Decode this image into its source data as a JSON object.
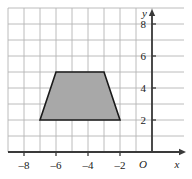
{
  "figure": {
    "name": "coordinate-grid-with-trapezoid",
    "background_color": "#ffffff",
    "grid_color": "#b4b4b4",
    "axis_color": "#3a3a3a",
    "shape_fill_color": "#a8a8a8",
    "shape_stroke_color": "#1a1a1a"
  },
  "axes": {
    "x_label": "x",
    "y_label": "y",
    "origin_label": "O",
    "x_ticks": [
      {
        "value": -8,
        "label": "–8"
      },
      {
        "value": -6,
        "label": "–6"
      },
      {
        "value": -4,
        "label": "–4"
      },
      {
        "value": -2,
        "label": "–2"
      }
    ],
    "y_ticks": [
      {
        "value": 2,
        "label": "2"
      },
      {
        "value": 4,
        "label": "4"
      },
      {
        "value": 6,
        "label": "6"
      },
      {
        "value": 8,
        "label": "8"
      }
    ]
  },
  "chart_data": {
    "type": "scatter",
    "title": "",
    "xlabel": "x",
    "ylabel": "y",
    "xlim": [
      -9,
      0.5
    ],
    "ylim": [
      0,
      9
    ],
    "grid": true,
    "grid_step": 1,
    "legend": "none",
    "shapes": [
      {
        "name": "trapezoid",
        "kind": "polygon",
        "fill": "#a8a8a8",
        "stroke": "#1a1a1a",
        "vertices": [
          {
            "x": -7,
            "y": 2
          },
          {
            "x": -6,
            "y": 5
          },
          {
            "x": -3,
            "y": 5
          },
          {
            "x": -2,
            "y": 2
          }
        ]
      }
    ]
  }
}
